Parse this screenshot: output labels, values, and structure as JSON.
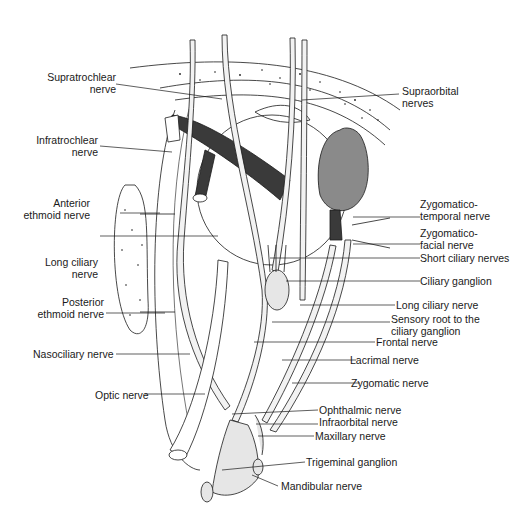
{
  "figure": {
    "colors": {
      "ink": "#1a1a1a",
      "muscle": "#3a3a3a",
      "gland": "#8a8a8a",
      "nerve_fill": "#f2f2f2",
      "ganglion_fill": "#e6e6e6"
    }
  },
  "labels_left": [
    {
      "id": "supratrochlear",
      "lines": [
        "Supratrochlear",
        "nerve"
      ]
    },
    {
      "id": "infratrochlear",
      "lines": [
        "Infratrochlear",
        "nerve"
      ]
    },
    {
      "id": "anterior-ethmoid",
      "lines": [
        "Anterior",
        "ethmoid nerve"
      ]
    },
    {
      "id": "long-ciliary-left",
      "lines": [
        "Long ciliary",
        "nerve"
      ]
    },
    {
      "id": "posterior-ethmoid",
      "lines": [
        "Posterior",
        "ethmoid nerve"
      ]
    },
    {
      "id": "nasociliary",
      "lines": [
        "Nasociliary nerve"
      ]
    },
    {
      "id": "optic",
      "lines": [
        "Optic nerve"
      ]
    }
  ],
  "labels_right": [
    {
      "id": "supraorbital",
      "lines": [
        "Supraorbital",
        "nerves"
      ]
    },
    {
      "id": "zygomaticotemporal",
      "lines": [
        "Zygomatico-",
        "temporal nerve"
      ]
    },
    {
      "id": "zygomaticofacial",
      "lines": [
        "Zygomatico-",
        "facial nerve"
      ]
    },
    {
      "id": "short-ciliary",
      "lines": [
        "Short ciliary nerves"
      ]
    },
    {
      "id": "ciliary-ganglion",
      "lines": [
        "Ciliary ganglion"
      ]
    },
    {
      "id": "long-ciliary-right",
      "lines": [
        "Long ciliary nerve"
      ]
    },
    {
      "id": "sensory-root",
      "lines": [
        "Sensory root to the",
        "ciliary ganglion"
      ]
    },
    {
      "id": "frontal",
      "lines": [
        "Frontal nerve"
      ]
    },
    {
      "id": "lacrimal",
      "lines": [
        "Lacrimal nerve"
      ]
    },
    {
      "id": "zygomatic",
      "lines": [
        "Zygomatic nerve"
      ]
    },
    {
      "id": "ophthalmic",
      "lines": [
        "Ophthalmic nerve"
      ]
    },
    {
      "id": "infraorbital",
      "lines": [
        "Infraorbital nerve"
      ]
    },
    {
      "id": "maxillary",
      "lines": [
        "Maxillary nerve"
      ]
    },
    {
      "id": "trigeminal-ganglion",
      "lines": [
        "Trigeminal ganglion"
      ]
    },
    {
      "id": "mandibular",
      "lines": [
        "Mandibular nerve"
      ]
    }
  ]
}
